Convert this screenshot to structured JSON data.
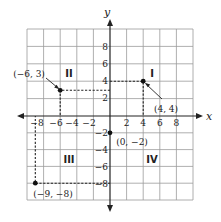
{
  "diagram": {
    "axes": {
      "x_label": "x",
      "y_label": "y",
      "x_ticks": [
        "−8",
        "−6",
        "−4",
        "−2",
        "2",
        "4",
        "6",
        "8"
      ],
      "y_ticks": [
        "8",
        "6",
        "4",
        "2",
        "−2",
        "−4",
        "−6",
        "−8"
      ],
      "range": [
        -10,
        10
      ],
      "tick_step": 2
    },
    "quadrants": [
      {
        "id": "I",
        "label": "I"
      },
      {
        "id": "II",
        "label": "II"
      },
      {
        "id": "III",
        "label": "III"
      },
      {
        "id": "IV",
        "label": "IV"
      }
    ],
    "points": [
      {
        "x": 4,
        "y": 4,
        "label": "(4, 4)"
      },
      {
        "x": -6,
        "y": 3,
        "label": "(−6, 3)"
      },
      {
        "x": 0,
        "y": -2,
        "label": "(0, −2)"
      },
      {
        "x": -9,
        "y": -8,
        "label": "(−9, −8)"
      }
    ]
  }
}
